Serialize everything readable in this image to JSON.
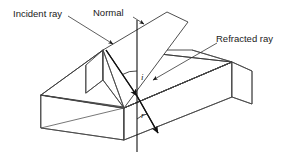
{
  "figure": {
    "background_color": "#ffffff",
    "block_fill": "#c9c9c9",
    "block_top_fill": "#c9c9c9",
    "plane_fill": "#ffffff",
    "edge_color": "#3a3a3a",
    "ray_color": "#111111"
  },
  "labels": {
    "incident_ray": "Incident ray",
    "normal": "Normal",
    "refracted_ray": "Refracted ray",
    "angle_of_incidence": "i",
    "angle_of_refraction": "r"
  }
}
